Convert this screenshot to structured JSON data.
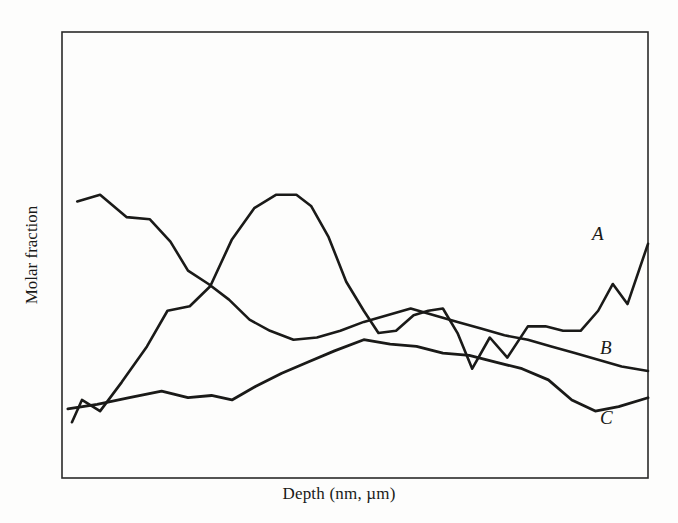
{
  "figure": {
    "width": 678,
    "height": 523,
    "background_color": "#fdfdfc",
    "ink_color": "#1a1a18"
  },
  "axes": {
    "x_label": "Depth (nm, µm)",
    "y_label": "Molar fraction",
    "frame": {
      "left": 62,
      "top": 32,
      "right": 648,
      "bottom": 478
    },
    "frame_color": "#2a2a28",
    "frame_width": 1.6,
    "ticks": "none",
    "gridlines": "none"
  },
  "labels": {
    "a": "A",
    "b": "B",
    "c": "C"
  },
  "chart_data": {
    "type": "line",
    "title": "",
    "xlabel": "Depth (nm, µm)",
    "ylabel": "Molar fraction",
    "xlim": [
      0,
      100
    ],
    "ylim": [
      0,
      100
    ],
    "grid": false,
    "legend": "inline-right-end-labels",
    "axis_ticks": false,
    "note": "Schematic depth-profile: relative molar fractions of three components A, B and C versus depth. Axes are unlabelled/unscaled; x and y are normalised 0-100 of the plot frame.",
    "series": [
      {
        "name": "A",
        "label": "A",
        "color": "#1a1a18",
        "x": [
          1.7,
          3.4,
          6.5,
          10.2,
          14.5,
          18.0,
          21.8,
          25.3,
          29.0,
          32.8,
          36.5,
          40.0,
          42.5,
          45.5,
          48.5,
          51.5,
          54.0,
          57.0,
          60.0,
          62.5,
          65.0,
          67.5,
          70.0,
          73.0,
          76.0,
          79.5,
          82.5,
          85.5,
          88.5,
          91.5,
          94.0,
          96.5,
          100.0
        ],
        "y": [
          12.5,
          17.5,
          15.0,
          21.5,
          29.5,
          37.5,
          38.5,
          43.0,
          53.5,
          60.5,
          63.5,
          63.5,
          61.0,
          54.0,
          44.0,
          37.5,
          32.5,
          33.0,
          36.5,
          37.5,
          38.0,
          32.5,
          24.5,
          31.5,
          27.0,
          34.0,
          34.0,
          33.0,
          33.0,
          37.5,
          43.5,
          39.0,
          52.5
        ]
      },
      {
        "name": "B",
        "label": "B",
        "color": "#1a1a18",
        "x": [
          2.6,
          6.5,
          11.0,
          15.0,
          18.5,
          21.5,
          25.0,
          28.5,
          32.0,
          35.5,
          39.5,
          43.5,
          47.5,
          51.5,
          55.5,
          59.5,
          63.5,
          67.5,
          71.5,
          75.5,
          79.5,
          83.5,
          87.5,
          91.5,
          95.5,
          100.0
        ],
        "y": [
          62.0,
          63.5,
          58.5,
          58.0,
          53.0,
          46.5,
          43.5,
          40.0,
          35.5,
          33.0,
          31.0,
          31.5,
          33.0,
          35.0,
          36.5,
          38.0,
          36.5,
          35.0,
          33.5,
          32.0,
          31.0,
          29.5,
          28.0,
          26.5,
          25.0,
          24.0
        ]
      },
      {
        "name": "C",
        "label": "C",
        "color": "#1a1a18",
        "x": [
          1.0,
          6.0,
          11.5,
          17.0,
          21.5,
          25.5,
          29.0,
          33.0,
          37.5,
          42.0,
          46.5,
          51.5,
          56.0,
          60.5,
          65.0,
          69.5,
          74.0,
          78.5,
          83.0,
          87.0,
          91.0,
          95.0,
          100.0
        ],
        "y": [
          15.5,
          16.5,
          18.0,
          19.5,
          18.0,
          18.5,
          17.5,
          20.5,
          23.5,
          26.0,
          28.5,
          31.0,
          30.0,
          29.5,
          28.0,
          27.5,
          26.0,
          24.5,
          22.0,
          17.5,
          15.0,
          16.0,
          18.0
        ]
      }
    ]
  }
}
